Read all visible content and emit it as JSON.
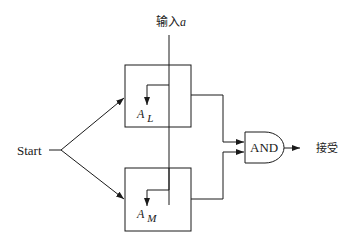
{
  "diagram": {
    "input_label": "输入",
    "input_var": "a",
    "start_label": "Start",
    "automaton_top": {
      "name": "A",
      "subscript": "L"
    },
    "automaton_bottom": {
      "name": "A",
      "subscript": "M"
    },
    "gate_label": "AND",
    "output_label": "接受",
    "colors": {
      "stroke": "#1a1a1a",
      "background": "#ffffff"
    }
  }
}
